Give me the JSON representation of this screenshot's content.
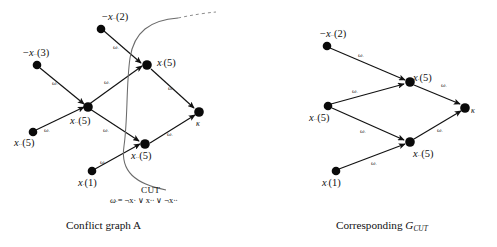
{
  "figure": {
    "panels": [
      {
        "id": "conflict-graph-a",
        "caption": "Conflict graph A",
        "nodes": [
          {
            "id": "n-neg-x-2",
            "label_prefix": "−",
            "label_var": "x",
            "label_sub": "∙∙",
            "label_value": "(2)"
          },
          {
            "id": "n-neg-x-3",
            "label_prefix": "−",
            "label_var": "x",
            "label_sub": "∙∙",
            "label_value": "(3)"
          },
          {
            "id": "n-x-5-mid",
            "label_prefix": "",
            "label_var": "x",
            "label_sub": "∙",
            "label_value": "(5)"
          },
          {
            "id": "n-x-5-left",
            "label_prefix": "",
            "label_var": "x",
            "label_sub": "∙∙",
            "label_value": "(5)"
          },
          {
            "id": "n-x-5-low",
            "label_prefix": "",
            "label_var": "x",
            "label_sub": "∙∙",
            "label_value": "(5)"
          },
          {
            "id": "n-x-5-bot",
            "label_prefix": "",
            "label_var": "x",
            "label_sub": "∙∙",
            "label_value": "(5)"
          },
          {
            "id": "n-x-1",
            "label_prefix": "",
            "label_var": "x",
            "label_sub": "∙",
            "label_value": "(1)"
          },
          {
            "id": "n-kappa",
            "label_prefix": "",
            "label_var": "κ",
            "label_sub": "",
            "label_value": ""
          }
        ],
        "edge_label": {
          "var": "ω",
          "sub": "∙"
        },
        "cut": {
          "label": "CUT",
          "formula_lhs_var": "ω",
          "formula_lhs_sub": "∙",
          "formula": "= ¬x∙ ∨ x∙∙ ∨ ¬x∙∙"
        }
      },
      {
        "id": "corresponding-gcut",
        "caption_prefix": "Corresponding ",
        "caption_symbol": "G",
        "caption_subscript": "CUT",
        "nodes": [
          {
            "id": "r-neg-x-2",
            "label_prefix": "−",
            "label_var": "x",
            "label_sub": "∙∙",
            "label_value": "(2)"
          },
          {
            "id": "r-x-5-up",
            "label_prefix": "",
            "label_var": "x",
            "label_sub": "∙",
            "label_value": "(5)"
          },
          {
            "id": "r-x-5-left",
            "label_prefix": "",
            "label_var": "x",
            "label_sub": "∙∙",
            "label_value": "(5)"
          },
          {
            "id": "r-x-5-low",
            "label_prefix": "",
            "label_var": "x",
            "label_sub": "∙∙",
            "label_value": "(5)"
          },
          {
            "id": "r-x-1",
            "label_prefix": "",
            "label_var": "x",
            "label_sub": "∙",
            "label_value": "(1)"
          },
          {
            "id": "r-kappa",
            "label_prefix": "",
            "label_var": "κ",
            "label_sub": "",
            "label_value": ""
          }
        ],
        "edge_label": {
          "var": "ω",
          "sub": "∙"
        }
      }
    ]
  },
  "labels": {
    "left": {
      "neg_x_2": {
        "pre": "−",
        "var": "x",
        "sub": "∙∙",
        "val": "(2)"
      },
      "neg_x_3": {
        "pre": "−",
        "var": "x",
        "sub": "∙∙",
        "val": "(3)"
      },
      "x_5_mid": {
        "pre": "",
        "var": "x",
        "sub": "∙",
        "val": "(5)"
      },
      "x_5_left": {
        "pre": "",
        "var": "x",
        "sub": "∙∙",
        "val": "(5)"
      },
      "x_5_low": {
        "pre": "",
        "var": "x",
        "sub": "∙∙",
        "val": "(5)"
      },
      "x_5_bot": {
        "pre": "",
        "var": "x",
        "sub": "∙∙",
        "val": "(5)"
      },
      "x_1": {
        "pre": "",
        "var": "x",
        "sub": "∙",
        "val": "(1)"
      },
      "kappa": "κ",
      "cut_word": "CUT",
      "omega": "ω",
      "omega_sub": "∙",
      "formula_rest": "= ¬x∙ ∨ x∙∙ ∨ ¬x∙∙"
    },
    "right": {
      "neg_x_2": {
        "pre": "−",
        "var": "x",
        "sub": "∙∙",
        "val": "(2)"
      },
      "x_5_up": {
        "pre": "",
        "var": "x",
        "sub": "∙",
        "val": "(5)"
      },
      "x_5_left": {
        "pre": "",
        "var": "x",
        "sub": "∙∙",
        "val": "(5)"
      },
      "x_5_low": {
        "pre": "",
        "var": "x",
        "sub": "∙∙",
        "val": "(5)"
      },
      "x_1": {
        "pre": "",
        "var": "x",
        "sub": "∙",
        "val": "(1)"
      },
      "kappa": "κ"
    },
    "edge": {
      "var": "ω",
      "sub": "∙"
    }
  },
  "captions": {
    "left": "Conflict graph A",
    "right_prefix": "Corresponding ",
    "right_symbol": "G",
    "right_subscript": "CUT"
  },
  "colors": {
    "ink": "#111111",
    "node": "#0a0a0a",
    "cut_curve": "#6b6b6b",
    "background": "#ffffff"
  }
}
